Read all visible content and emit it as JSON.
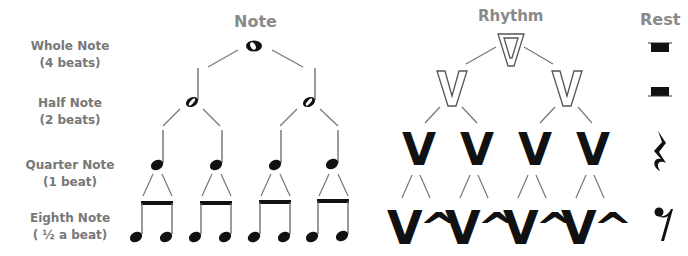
{
  "headers": {
    "note": "Note",
    "rhythm": "Rhythm",
    "rest": "Rest"
  },
  "rows": [
    {
      "name": "Whole Note",
      "beats": "(4 beats)"
    },
    {
      "name": "Half Note",
      "beats": "(2 beats)"
    },
    {
      "name": "Quarter Note",
      "beats": "(1 beat)"
    },
    {
      "name": "Eighth Note",
      "beats": "( ½  a beat)"
    }
  ],
  "rhythm": {
    "long": "V",
    "short": "^"
  },
  "colors": {
    "label": "#777777",
    "header": "#8a8a8a",
    "line": "#777777",
    "glyph": "#111111"
  }
}
